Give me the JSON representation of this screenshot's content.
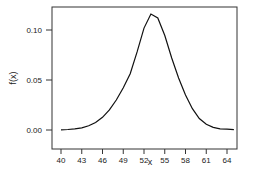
{
  "chart_data": {
    "type": "line",
    "title": "",
    "xlabel": "x",
    "ylabel": "f(x)",
    "xlim": [
      38.7,
      66.5
    ],
    "ylim": [
      -0.0055,
      0.1227
    ],
    "xticks": [
      40,
      43,
      46,
      49,
      52,
      55,
      58,
      61,
      64
    ],
    "xtick_labels": [
      "40",
      "43",
      "46",
      "49",
      "52",
      "55",
      "58",
      "61",
      "64"
    ],
    "yticks": [
      0.0,
      0.05,
      0.1
    ],
    "ytick_labels": [
      "0.00",
      "0.05",
      "0.10"
    ],
    "grid": false,
    "legend": null,
    "series": [
      {
        "name": "f(x)",
        "x": [
          40,
          41,
          42,
          43,
          44,
          45,
          46,
          47,
          48,
          49,
          50,
          51,
          52,
          53,
          54,
          55,
          56,
          57,
          58,
          59,
          60,
          61,
          62,
          63,
          64,
          65
        ],
        "values": [
          0.0002,
          0.0005,
          0.0011,
          0.0022,
          0.0042,
          0.0075,
          0.0127,
          0.0201,
          0.03,
          0.0423,
          0.0563,
          0.0781,
          0.1019,
          0.116,
          0.112,
          0.0945,
          0.072,
          0.052,
          0.035,
          0.0213,
          0.0115,
          0.0057,
          0.0026,
          0.0012,
          0.0008,
          0.0003
        ]
      }
    ],
    "color": "#111111"
  }
}
